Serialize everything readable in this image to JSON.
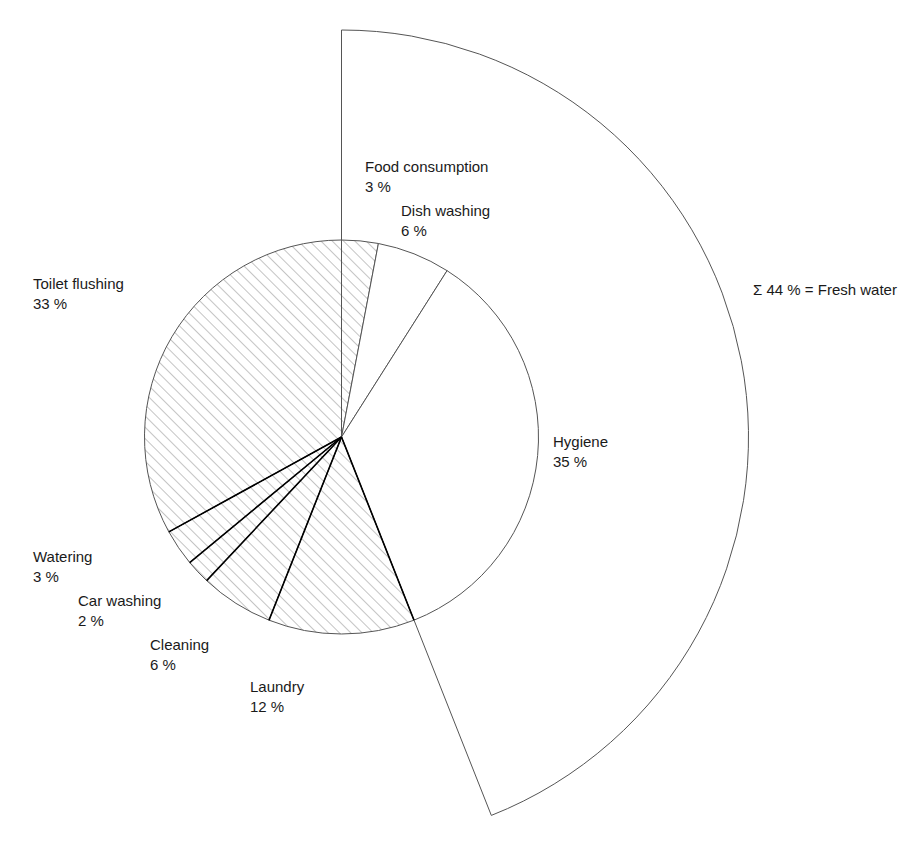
{
  "chart_data": {
    "type": "pie",
    "title": "",
    "subtitle": "",
    "xlabel": "",
    "ylabel": "",
    "unit": "%",
    "start_angle_deg": 0,
    "direction": "clockwise",
    "grid": false,
    "legend_position": "none",
    "labels_inline": true,
    "categories": [
      "Food consumption",
      "Dish washing",
      "Hygiene",
      "Laundry",
      "Cleaning",
      "Car washing",
      "Watering",
      "Toilet flushing"
    ],
    "values": [
      3,
      6,
      35,
      12,
      6,
      2,
      3,
      33
    ],
    "value_labels": [
      "3 %",
      "6 %",
      "35 %",
      "12 %",
      "6 %",
      "2 %",
      "3 %",
      "33 %"
    ],
    "fills": [
      "hatched",
      "plain",
      "plain",
      "hatched",
      "hatched",
      "hatched",
      "hatched",
      "hatched"
    ],
    "annotations": [
      {
        "id": "fresh-water-sum",
        "text": "Σ 44 % = Fresh water",
        "covers": [
          "Food consumption",
          "Dish washing",
          "Hygiene"
        ],
        "sum": 44
      }
    ],
    "total": 100
  },
  "slices": [
    {
      "name": "Food consumption",
      "value_label": "3 %",
      "label_x": 365,
      "label_y": 172,
      "value_x": 365,
      "value_y": 192
    },
    {
      "name": "Dish washing",
      "value_label": "6 %",
      "label_x": 401,
      "label_y": 216,
      "value_x": 401,
      "value_y": 236
    },
    {
      "name": "Hygiene",
      "value_label": "35 %",
      "label_x": 553,
      "label_y": 447,
      "value_x": 553,
      "value_y": 467
    },
    {
      "name": "Laundry",
      "value_label": "12 %",
      "label_x": 250,
      "label_y": 692,
      "value_x": 250,
      "value_y": 712
    },
    {
      "name": "Cleaning",
      "value_label": "6 %",
      "label_x": 150,
      "label_y": 650,
      "value_x": 150,
      "value_y": 670
    },
    {
      "name": "Car washing",
      "value_label": "2 %",
      "label_x": 78,
      "label_y": 606,
      "value_x": 78,
      "value_y": 626
    },
    {
      "name": "Watering",
      "value_label": "3 %",
      "label_x": 33,
      "label_y": 562,
      "value_x": 33,
      "value_y": 582
    },
    {
      "name": "Toilet flushing",
      "value_label": "33 %",
      "label_x": 33,
      "label_y": 289,
      "value_x": 33,
      "value_y": 309
    }
  ],
  "sum_annotation": {
    "text": "Σ 44 % = Fresh water",
    "x": 753,
    "y": 295
  },
  "style": {
    "background": "#ffffff",
    "line_color": "#555555",
    "strong_line_color": "#000000",
    "hatch_color": "#8a8a8a",
    "text_color": "#1a1a1a"
  }
}
